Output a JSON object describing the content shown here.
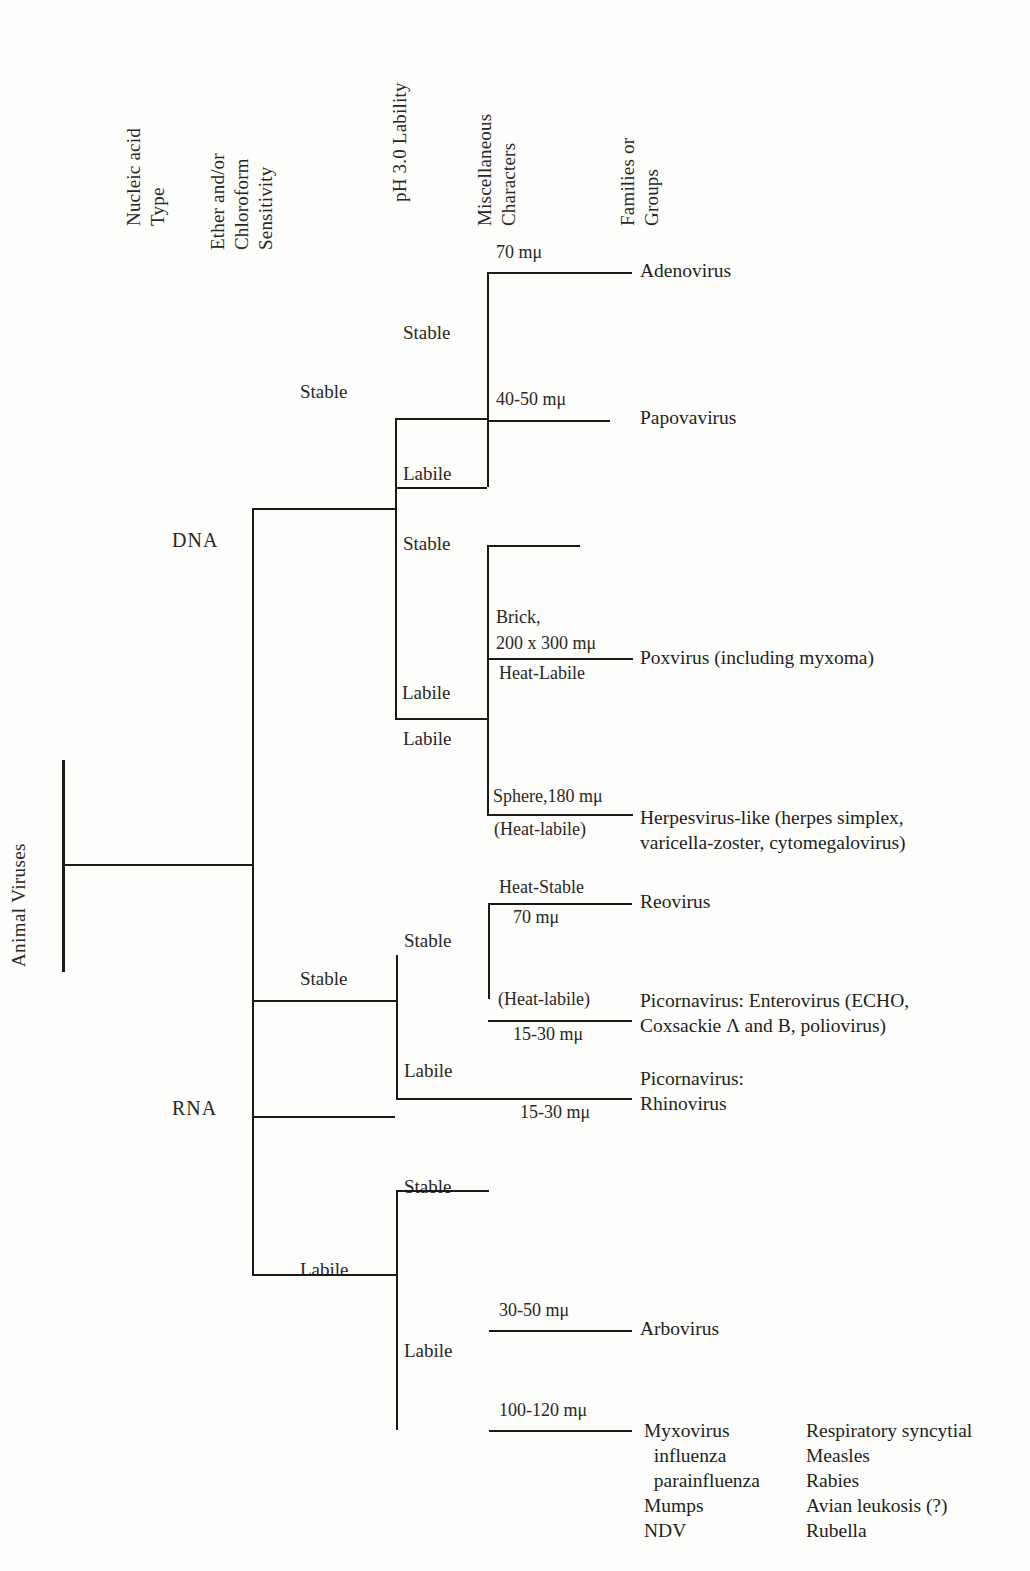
{
  "figure": {
    "root_label": "Animal Viruses",
    "columns": [
      {
        "id": "nucleic-acid-type",
        "text": "Nucleic acid\nType"
      },
      {
        "id": "ether-chloroform-sensitivity",
        "text": "Ether and/or\nChloroform\nSensitivity"
      },
      {
        "id": "ph-3-lability",
        "text": "pH 3.0 Lability"
      },
      {
        "id": "miscellaneous-characters",
        "text": "Miscellaneous\nCharacters"
      },
      {
        "id": "families-or-groups",
        "text": "Families or\nGroups"
      }
    ],
    "nucleic_acid": {
      "dna": "DNA",
      "rna": "RNA"
    },
    "edges": {
      "stable": "Stable",
      "labile": "Labile"
    },
    "branches": {
      "dna_stable": "Stable",
      "dna_labile": "Labile",
      "dna_stable_ph_stable": "Stable",
      "dna_stable_ph_labile": "Labile",
      "dna_labile_ph_stable": "Stable",
      "dna_labile_ph_labile": "Labile",
      "rna_stable": "Stable",
      "rna_labile": "Labile",
      "rna_stable_ph_stable": "Stable",
      "rna_stable_ph_labile": "Labile",
      "rna_labile_ph_stable": "Stable",
      "rna_labile_ph_labile": "Labile"
    },
    "misc_characters": {
      "adenovirus_size": "70 mμ",
      "papovavirus_size": "40-50 mμ",
      "poxvirus_shape": "Brick,",
      "poxvirus_size": "200 x 300 mμ",
      "poxvirus_heat": "Heat-Labile",
      "herpesvirus_size": "Sphere,180 mμ",
      "herpesvirus_heat": "(Heat-labile)",
      "reovirus_heat": "Heat-Stable",
      "reovirus_size": "70 mμ",
      "enterovirus_heat": "(Heat-labile)",
      "enterovirus_size": "15-30 mμ",
      "rhinovirus_size": "15-30 mμ",
      "arbovirus_size": "30-50 mμ",
      "myxovirus_size": "100-120 mμ"
    },
    "families": {
      "adenovirus": "Adenovirus",
      "papovavirus": "Papovavirus",
      "poxvirus": "Poxvirus (including myxoma)",
      "herpesvirus": "Herpesvirus-like (herpes simplex,\nvaricella-zoster, cytomegalovirus)",
      "reovirus": "Reovirus",
      "enterovirus": "Picornavirus: Enterovirus (ECHO,\nCoxsackie Λ and B, poliovirus)",
      "rhinovirus": "Picornavirus:\nRhinovirus",
      "arbovirus": "Arbovirus",
      "myxovirus_col1": "Myxovirus\n  influenza\n  parainfluenza\nMumps\nNDV",
      "myxovirus_col2": "Respiratory syncytial\nMeasles\nRabies\nAvian leukosis (?)\nRubella"
    }
  }
}
